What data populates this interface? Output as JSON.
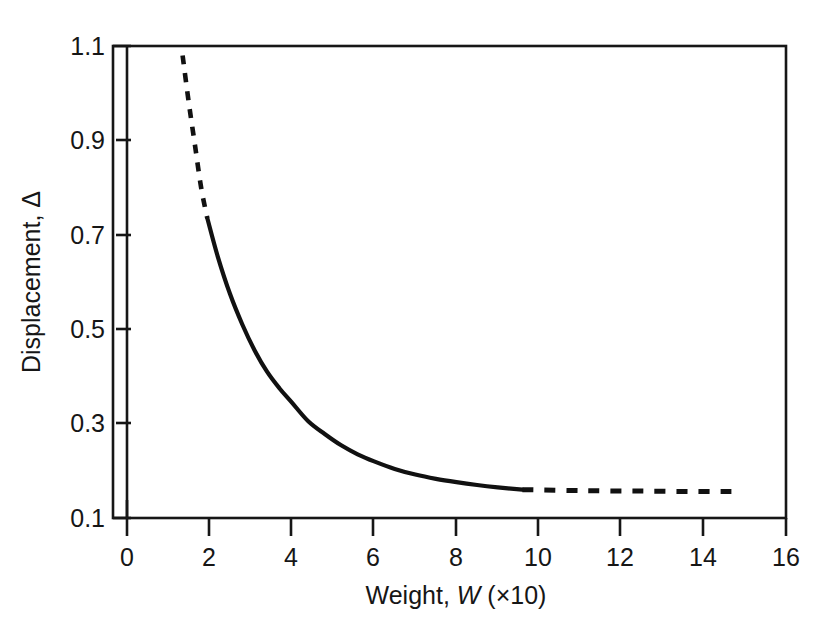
{
  "chart_data": {
    "type": "line",
    "title": "",
    "xlabel": "Weight, W (×10)",
    "xlabel_parts": {
      "prefix": "Weight, ",
      "italic": "W",
      "suffix": " (×10)"
    },
    "ylabel": "Displacement, Δ",
    "xlim": [
      0,
      16
    ],
    "ylim": [
      0.1,
      1.1
    ],
    "xticks": [
      0,
      2,
      4,
      6,
      8,
      10,
      12,
      14,
      16
    ],
    "xtick_labels": [
      "0",
      "2",
      "4",
      "6",
      "8",
      "10",
      "12",
      "14",
      "16"
    ],
    "yticks": [
      0.1,
      0.3,
      0.5,
      0.7,
      0.9,
      1.1
    ],
    "ytick_labels": [
      "0.1",
      "0.3",
      "0.5",
      "0.7",
      "0.9",
      "1.1"
    ],
    "grid": false,
    "legend": null,
    "line_color": "#111111",
    "frame_color": "#161616",
    "background": "#ffffff",
    "series": [
      {
        "name": "Displacement vs Weight",
        "style_segments": [
          {
            "style": "dashed",
            "comment": "extrapolated low-weight region",
            "x": [
              1.35,
              1.5,
              1.65,
              1.8,
              1.95
            ],
            "y": [
              1.08,
              0.98,
              0.89,
              0.8,
              0.735
            ]
          },
          {
            "style": "solid",
            "comment": "measured region",
            "x": [
              1.95,
              2.2,
              2.5,
              2.8,
              3.1,
              3.4,
              3.7,
              4.0,
              4.4,
              4.8,
              5.2,
              5.6,
              6.0,
              6.5,
              7.0,
              7.5,
              8.0,
              8.5,
              9.0,
              9.6
            ],
            "y": [
              0.735,
              0.655,
              0.575,
              0.51,
              0.455,
              0.41,
              0.375,
              0.345,
              0.305,
              0.278,
              0.254,
              0.235,
              0.22,
              0.204,
              0.192,
              0.183,
              0.176,
              0.17,
              0.165,
              0.16
            ]
          },
          {
            "style": "dashed",
            "comment": "extrapolated high-weight asymptote",
            "x": [
              9.6,
              11.0,
              12.5,
              14.0,
              14.8
            ],
            "y": [
              0.16,
              0.158,
              0.157,
              0.156,
              0.156
            ]
          }
        ]
      }
    ]
  }
}
